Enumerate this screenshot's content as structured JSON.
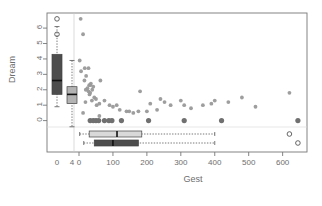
{
  "chart_data": {
    "type": "scatter",
    "title": "",
    "xlabel": "Gest",
    "ylabel": "Dream",
    "xlim": [
      -95,
      680
    ],
    "ylim": [
      -0.75,
      6.8
    ],
    "grid": false,
    "legend": null,
    "x_ticks": [
      0,
      100,
      200,
      300,
      400,
      500,
      600
    ],
    "x_tick_labels": [
      "0",
      "100",
      "200",
      "300",
      "400",
      "500",
      "600"
    ],
    "y_ticks": [
      0,
      1,
      2,
      3,
      4,
      5,
      6
    ],
    "y_tick_labels": [
      "0",
      "1",
      "2",
      "3",
      "4",
      "5",
      "6"
    ],
    "inner_x_ticks": [
      0,
      4
    ],
    "inner_x_tick_labels": [
      "0",
      "4"
    ],
    "points": [
      [
        4.9,
        6.6
      ],
      [
        12.0,
        5.6
      ],
      [
        2.0,
        3.9
      ],
      [
        6.1,
        3.2
      ],
      [
        28.0,
        3.4
      ],
      [
        17.0,
        3.4
      ],
      [
        21.0,
        2.9
      ],
      [
        16.0,
        2.6
      ],
      [
        35.0,
        2.4
      ],
      [
        30.0,
        2.3
      ],
      [
        33.0,
        2.3
      ],
      [
        25.0,
        2.1
      ],
      [
        20.0,
        2.0
      ],
      [
        39.0,
        2.0
      ],
      [
        42.0,
        2.2
      ],
      [
        28.0,
        1.9
      ],
      [
        33.0,
        1.8
      ],
      [
        31.0,
        1.7
      ],
      [
        45.0,
        1.5
      ],
      [
        50.0,
        1.4
      ],
      [
        19.0,
        1.2
      ],
      [
        38.0,
        1.3
      ],
      [
        52.0,
        1.0
      ],
      [
        60.0,
        1.1
      ],
      [
        63.0,
        2.6
      ],
      [
        75.0,
        1.3
      ],
      [
        90.0,
        1.0
      ],
      [
        100.0,
        0.9
      ],
      [
        111.0,
        1.0
      ],
      [
        120.0,
        0.7
      ],
      [
        140.0,
        0.6
      ],
      [
        148.0,
        0.6
      ],
      [
        160.0,
        0.5
      ],
      [
        175.0,
        0.6
      ],
      [
        180.0,
        1.9
      ],
      [
        200.0,
        0.6
      ],
      [
        210.0,
        1.1
      ],
      [
        230.0,
        0.7
      ],
      [
        240.0,
        1.4
      ],
      [
        252.0,
        1.2
      ],
      [
        270.0,
        1.0
      ],
      [
        300.0,
        1.3
      ],
      [
        310.0,
        1.0
      ],
      [
        330.0,
        0.8
      ],
      [
        365.0,
        1.0
      ],
      [
        390.0,
        1.1
      ],
      [
        400.0,
        1.3
      ],
      [
        440.0,
        1.2
      ],
      [
        480.0,
        1.5
      ],
      [
        520.0,
        0.9
      ],
      [
        620.0,
        1.8
      ],
      [
        12.0,
        0.5
      ],
      [
        60.0,
        0.3
      ]
    ],
    "zero_row_points": [
      [
        33.0,
        0.0
      ],
      [
        42.0,
        0.0
      ],
      [
        50.0,
        0.0
      ],
      [
        58.0,
        0.0
      ],
      [
        75.0,
        0.0
      ],
      [
        88.0,
        0.0
      ],
      [
        97.0,
        0.0
      ],
      [
        125.0,
        0.0
      ],
      [
        205.0,
        0.0
      ],
      [
        310.0,
        0.0
      ],
      [
        420.0,
        0.0
      ],
      [
        645.0,
        0.0
      ]
    ],
    "y_marginal_boxplots": [
      {
        "name": "box-dark",
        "fill": "#4d4d4d",
        "slot": 0,
        "min": 0.9,
        "q1": 1.7,
        "median": 2.6,
        "q3": 4.3,
        "max": 6.1,
        "outliers": [
          6.6,
          5.6
        ]
      },
      {
        "name": "box-light",
        "fill": "#b3b3b3",
        "slot": 1,
        "min": -0.4,
        "q1": 1.1,
        "median": 1.7,
        "q3": 2.2,
        "max": 3.9,
        "outliers": []
      }
    ],
    "x_marginal_boxplots": [
      {
        "name": "box-light-h",
        "fill": "#d9d9d9",
        "slot": 0,
        "min": 2.0,
        "q1": 30.0,
        "median": 112.0,
        "q3": 185.0,
        "max": 400.0,
        "outliers": [
          620.0
        ]
      },
      {
        "name": "box-dark-h",
        "fill": "#4d4d4d",
        "slot": 1,
        "min": 14.0,
        "q1": 45.0,
        "median": 100.0,
        "q3": 175.0,
        "max": 400.0,
        "outliers": [
          645.0
        ]
      }
    ],
    "marginal_outlier_points_right": [
      [
        620.0,
        0.0
      ],
      [
        645.0,
        0.0
      ]
    ],
    "point_color": "#999999",
    "zero_point_color": "#707070",
    "frame_color": "#777777"
  },
  "axes": {
    "ylabel": "Dream",
    "xlabel": "Gest"
  }
}
